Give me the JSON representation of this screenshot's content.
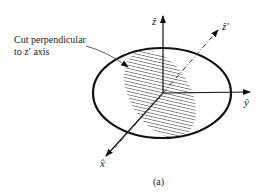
{
  "figure": {
    "caption": "(a)",
    "annotation_line1": "Cut perpendicular",
    "annotation_line2": "to z′ axis",
    "axes": {
      "z": "ẑ",
      "z_prime": "ẑ′",
      "y": "ŷ",
      "x": "x̂"
    },
    "colors": {
      "stroke": "#111111",
      "background": "#ffffff",
      "text": "#222222"
    }
  }
}
